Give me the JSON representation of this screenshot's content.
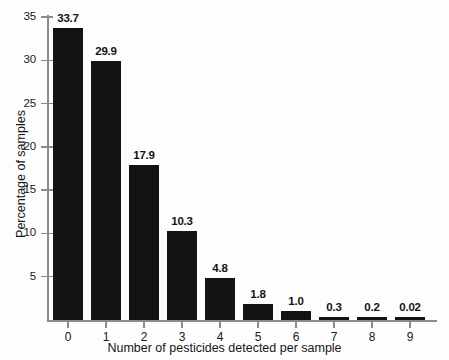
{
  "chart_data": {
    "type": "bar",
    "title": "",
    "subtitle": "",
    "xlabel": "Number of pesticides detected per sample",
    "ylabel": "Percentage of samples",
    "categories": [
      "0",
      "1",
      "2",
      "3",
      "4",
      "5",
      "6",
      "7",
      "8",
      "9"
    ],
    "values": [
      33.7,
      29.9,
      17.9,
      10.3,
      4.8,
      1.8,
      1.0,
      0.3,
      0.2,
      0.02
    ],
    "data_labels": [
      "33.7",
      "29.9",
      "17.9",
      "10.3",
      "4.8",
      "1.8",
      "1.0",
      "0.3",
      "0.2",
      "0.02"
    ],
    "ylim": [
      0,
      35
    ],
    "xlim": [
      -0.5,
      9.5
    ],
    "y_ticks": [
      5,
      10,
      15,
      20,
      25,
      30,
      35
    ],
    "y_tick_labels": [
      "5",
      "10",
      "15",
      "20",
      "25",
      "30",
      "35"
    ],
    "grid": false,
    "legend": false,
    "legend_position": "none",
    "bar_color": "#131313",
    "axis_color": "#8a8a8a",
    "background_color": "#fdfdfd",
    "series": [
      {
        "name": "Percentage of samples",
        "values": [
          33.7,
          29.9,
          17.9,
          10.3,
          4.8,
          1.8,
          1.0,
          0.3,
          0.2,
          0.02
        ]
      }
    ]
  }
}
